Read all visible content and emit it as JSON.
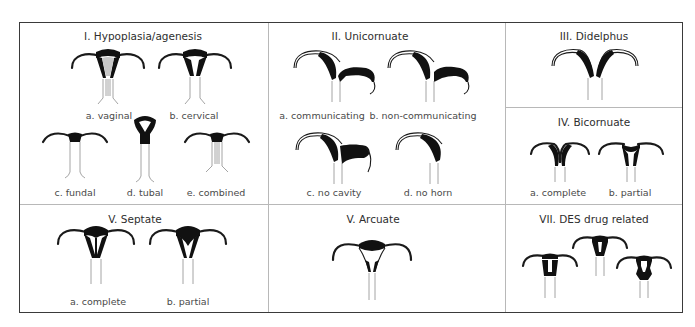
{
  "figure": {
    "sections": [
      {
        "id": "I",
        "title": "I. Hypoplasia/agenesis",
        "items": [
          {
            "label": "a. vaginal"
          },
          {
            "label": "b. cervical"
          },
          {
            "label": "c. fundal"
          },
          {
            "label": "d. tubal"
          },
          {
            "label": "e. combined"
          }
        ]
      },
      {
        "id": "II",
        "title": "II. Unicornuate",
        "items": [
          {
            "label": "a. communicating"
          },
          {
            "label": "b. non-communicating"
          },
          {
            "label": "c. no cavity"
          },
          {
            "label": "d. no horn"
          }
        ]
      },
      {
        "id": "III",
        "title": "III. Didelphus",
        "items": []
      },
      {
        "id": "IV",
        "title": "IV. Bicornuate",
        "items": [
          {
            "label": "a. complete"
          },
          {
            "label": "b. partial"
          }
        ]
      },
      {
        "id": "V-septate",
        "title": "V. Septate",
        "items": [
          {
            "label": "a. complete"
          },
          {
            "label": "b. partial"
          }
        ]
      },
      {
        "id": "V-arcuate",
        "title": "V. Arcuate",
        "items": []
      },
      {
        "id": "VII",
        "title": "VII. DES drug related",
        "items": []
      }
    ],
    "colors": {
      "border": "#3a3a3a",
      "divider": "#b8b8b8",
      "fill": "#111111",
      "shade": "#c8c8c8"
    }
  }
}
